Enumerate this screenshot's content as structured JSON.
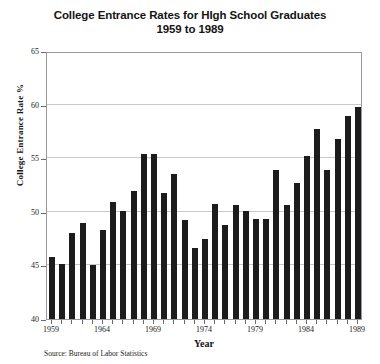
{
  "chart_data": {
    "type": "bar",
    "title": "College Entrance Rates for HIgh School Graduates",
    "subtitle": "1959 to 1989",
    "xlabel": "Year",
    "ylabel": "College Entrance Rate %",
    "ylim": [
      40,
      65
    ],
    "ytick_values": [
      40,
      45,
      50,
      55,
      60,
      65
    ],
    "ytick_labels": [
      "40",
      "45",
      "50",
      "55",
      "60",
      "65"
    ],
    "xtick_labels": [
      "1959",
      "1964",
      "1969",
      "1974",
      "1979",
      "1984",
      "1989"
    ],
    "xtick_categories": [
      "1959",
      "1964",
      "1969",
      "1974",
      "1979",
      "1984",
      "1989"
    ],
    "grid": true,
    "legend": "none",
    "bar_color": "#1c1c1c",
    "categories": [
      "1959",
      "1960",
      "1961",
      "1962",
      "1963",
      "1964",
      "1965",
      "1966",
      "1967",
      "1968",
      "1969",
      "1970",
      "1971",
      "1972",
      "1973",
      "1974",
      "1975",
      "1976",
      "1977",
      "1978",
      "1979",
      "1980",
      "1981",
      "1982",
      "1983",
      "1984",
      "1985",
      "1986",
      "1987",
      "1988",
      "1989"
    ],
    "values": [
      45.8,
      45.1,
      48.0,
      49.0,
      45.0,
      48.3,
      50.9,
      50.1,
      51.9,
      55.4,
      55.4,
      51.8,
      53.5,
      49.2,
      46.6,
      47.5,
      50.7,
      48.8,
      50.6,
      50.1,
      49.3,
      49.3,
      53.9,
      50.6,
      52.7,
      55.2,
      57.7,
      53.9,
      56.8,
      58.9,
      59.8
    ],
    "source_note": "Source: Bureau of Labor Statistics"
  }
}
